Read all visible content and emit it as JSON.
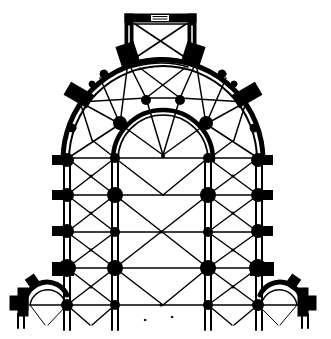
{
  "figure": {
    "ink_color": "#000000",
    "paper_color": "#ffffff",
    "parts": {
      "axial_chapel": "rectangular axial chapel with diagonal rib vault",
      "hemicycle": "semicircular ambulatory with radiating ribs",
      "inner_arcade": "inner apse arcade",
      "bays": "straight choir bays with quadripartite vaults",
      "corner_chapels": "two round chapels at lower corners"
    }
  }
}
